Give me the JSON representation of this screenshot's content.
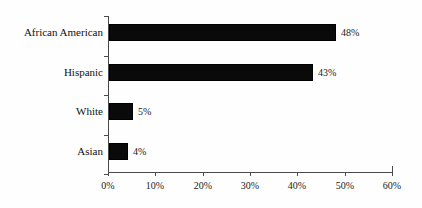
{
  "chart_data": {
    "type": "bar",
    "orientation": "horizontal",
    "title": "",
    "subtitle": "",
    "xlabel": "",
    "ylabel": "",
    "categories": [
      "African American",
      "Hispanic",
      "White",
      "Asian"
    ],
    "values": [
      48,
      43,
      5,
      4
    ],
    "value_labels": [
      "48%",
      "43%",
      "5%",
      "4%"
    ],
    "xlim": [
      0,
      60
    ],
    "xticks": [
      0,
      10,
      20,
      30,
      40,
      50,
      60
    ],
    "xtick_labels": [
      "0%",
      "10%",
      "20%",
      "30%",
      "40%",
      "50%",
      "60%"
    ],
    "grid": false,
    "legend": null,
    "bar_color": "#000000",
    "axis_color": "#4a4a4a",
    "background_color": "#fefefe",
    "series": [
      {
        "name": "",
        "values": [
          48,
          43,
          5,
          4
        ]
      }
    ]
  },
  "bars": [
    {
      "label": "African American",
      "value": 48,
      "value_label": "48%"
    },
    {
      "label": "Hispanic",
      "value": 43,
      "value_label": "43%"
    },
    {
      "label": "White",
      "value": 5,
      "value_label": "5%"
    },
    {
      "label": "Asian",
      "value": 4,
      "value_label": "4%"
    }
  ],
  "axis": {
    "ticks": [
      {
        "value": 0,
        "label": "0%"
      },
      {
        "value": 10,
        "label": "10%"
      },
      {
        "value": 20,
        "label": "20%"
      },
      {
        "value": 30,
        "label": "30%"
      },
      {
        "value": 40,
        "label": "40%"
      },
      {
        "value": 50,
        "label": "50%"
      },
      {
        "value": 60,
        "label": "60%"
      }
    ]
  }
}
